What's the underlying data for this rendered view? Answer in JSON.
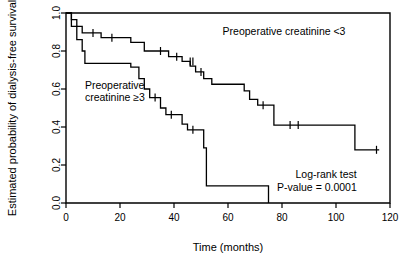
{
  "chart_data": {
    "type": "line",
    "title": "",
    "xlabel": "Time (months)",
    "ylabel": "Estimated probability of dialysis-free survival",
    "xlim": [
      0,
      120
    ],
    "ylim": [
      0.0,
      1.0
    ],
    "xticks": [
      0,
      20,
      40,
      60,
      80,
      100,
      120
    ],
    "xtick_labels": [
      "0",
      "20",
      "40",
      "60",
      "80",
      "100",
      "120"
    ],
    "yticks": [
      0.0,
      0.2,
      0.4,
      0.6,
      0.8,
      1.0
    ],
    "ytick_labels": [
      "0.0",
      "0.2",
      "0.4",
      "0.6",
      "0.8",
      "1.0"
    ],
    "grid": false,
    "legend_position": "inline-annotations",
    "series": [
      {
        "name": "Preoperative creatinine <3",
        "style": "kaplan-meier-step",
        "points": [
          [
            0,
            1.0
          ],
          [
            2,
            1.0
          ],
          [
            2,
            0.965
          ],
          [
            4,
            0.965
          ],
          [
            4,
            0.93
          ],
          [
            6,
            0.93
          ],
          [
            6,
            0.895
          ],
          [
            9,
            0.895
          ],
          [
            13,
            0.895
          ],
          [
            13,
            0.87
          ],
          [
            24,
            0.87
          ],
          [
            24,
            0.845
          ],
          [
            29,
            0.845
          ],
          [
            29,
            0.8
          ],
          [
            38,
            0.8
          ],
          [
            38,
            0.77
          ],
          [
            43,
            0.77
          ],
          [
            43,
            0.745
          ],
          [
            46,
            0.745
          ],
          [
            46,
            0.72
          ],
          [
            48,
            0.72
          ],
          [
            48,
            0.69
          ],
          [
            51,
            0.69
          ],
          [
            51,
            0.655
          ],
          [
            54,
            0.655
          ],
          [
            54,
            0.625
          ],
          [
            66,
            0.625
          ],
          [
            66,
            0.59
          ],
          [
            68,
            0.59
          ],
          [
            68,
            0.545
          ],
          [
            71,
            0.545
          ],
          [
            71,
            0.515
          ],
          [
            77,
            0.515
          ],
          [
            77,
            0.41
          ],
          [
            107,
            0.41
          ],
          [
            107,
            0.28
          ],
          [
            116,
            0.28
          ]
        ],
        "censored": [
          [
            10,
            0.895
          ],
          [
            17,
            0.87
          ],
          [
            35,
            0.8
          ],
          [
            41,
            0.77
          ],
          [
            46,
            0.745
          ],
          [
            47,
            0.745
          ],
          [
            50,
            0.69
          ],
          [
            73,
            0.515
          ],
          [
            83,
            0.41
          ],
          [
            86,
            0.41
          ],
          [
            115,
            0.28
          ]
        ]
      },
      {
        "name": "Preoperative creatinine ≥3",
        "style": "kaplan-meier-step",
        "points": [
          [
            0,
            1.0
          ],
          [
            2,
            1.0
          ],
          [
            2,
            0.93
          ],
          [
            4,
            0.93
          ],
          [
            4,
            0.86
          ],
          [
            6,
            0.86
          ],
          [
            6,
            0.8
          ],
          [
            7,
            0.8
          ],
          [
            7,
            0.735
          ],
          [
            24,
            0.735
          ],
          [
            24,
            0.715
          ],
          [
            27,
            0.715
          ],
          [
            27,
            0.655
          ],
          [
            29,
            0.655
          ],
          [
            29,
            0.6
          ],
          [
            31,
            0.6
          ],
          [
            31,
            0.555
          ],
          [
            35,
            0.555
          ],
          [
            35,
            0.5
          ],
          [
            37,
            0.5
          ],
          [
            37,
            0.465
          ],
          [
            43,
            0.465
          ],
          [
            43,
            0.415
          ],
          [
            45,
            0.415
          ],
          [
            45,
            0.385
          ],
          [
            51,
            0.385
          ],
          [
            51,
            0.29
          ],
          [
            52,
            0.29
          ],
          [
            52,
            0.09
          ],
          [
            75,
            0.09
          ],
          [
            75,
            0.0
          ]
        ],
        "censored": [
          [
            33,
            0.555
          ],
          [
            39,
            0.465
          ],
          [
            47,
            0.385
          ]
        ]
      }
    ],
    "annotations": [
      {
        "id": "label-upper",
        "text": "Preoperative creatinine <3",
        "x": 58,
        "y": 0.885
      },
      {
        "id": "label-lower-line1",
        "text": "Preoperative",
        "x": 7,
        "y": 0.6
      },
      {
        "id": "label-lower-line2",
        "text": "creatinine ≥3",
        "x": 7,
        "y": 0.535
      },
      {
        "id": "logrank-line1",
        "text": "Log-rank test",
        "x": 104,
        "y": 0.13
      },
      {
        "id": "logrank-line2",
        "text": "P-value = 0.0001",
        "x": 104,
        "y": 0.065
      }
    ],
    "statistics": {
      "test": "Log-rank test",
      "p_value": "0.0001"
    }
  }
}
